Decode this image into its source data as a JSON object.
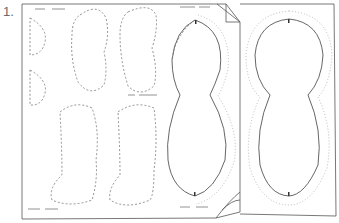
{
  "step": {
    "number": "1."
  },
  "diagram": {
    "colors": {
      "line": "#555555",
      "dashed": "#777777",
      "dotted": "#aaaaaa",
      "paper": "#ffffff"
    },
    "pieces": [
      {
        "name": "half-circle-top",
        "style": "dashed"
      },
      {
        "name": "half-circle-bottom",
        "style": "dashed"
      },
      {
        "name": "bean-top-left",
        "style": "dashed"
      },
      {
        "name": "bean-top-right",
        "style": "dashed"
      },
      {
        "name": "boot-bottom-left",
        "style": "dashed"
      },
      {
        "name": "boot-bottom-right",
        "style": "dashed"
      },
      {
        "name": "body-left",
        "style": "solid-with-seam"
      },
      {
        "name": "body-right",
        "style": "solid-with-seam"
      }
    ]
  }
}
